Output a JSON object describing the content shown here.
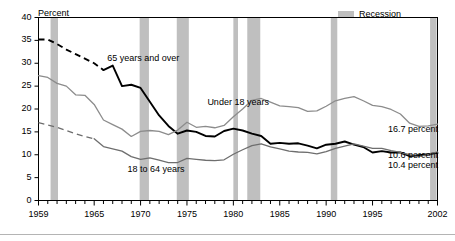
{
  "chart_data": {
    "type": "line",
    "title": "",
    "xlabel": "",
    "ylabel": "Percent",
    "ylim": [
      0,
      40
    ],
    "xlim": [
      1959,
      2002
    ],
    "yticks": [
      0,
      5,
      10,
      15,
      20,
      25,
      30,
      35,
      40
    ],
    "ytick_labels": [
      "0",
      "5",
      "10",
      "15",
      "20",
      "25",
      "30",
      "35",
      "40"
    ],
    "xticks": [
      1959,
      1965,
      1970,
      1975,
      1980,
      1985,
      1990,
      1995,
      2002
    ],
    "xtick_labels": [
      "1959",
      "1965",
      "1970",
      "1975",
      "1980",
      "1985",
      "1990",
      "1995",
      "2002"
    ],
    "minor_xticks_every": 1,
    "grid": false,
    "legend_position": "top-right",
    "legend": [
      {
        "label": "Recession",
        "color": "#bfbfbf",
        "type": "band"
      }
    ],
    "series": [
      {
        "name": "65 years and over",
        "color": "#000000",
        "width": 1.9,
        "label_x": 1966.4,
        "label_y": 31.0,
        "end_label": "10.4 percent",
        "dashed_prefix_years": 7,
        "x": [
          1959,
          1960,
          1961,
          1962,
          1963,
          1964,
          1965,
          1966,
          1967,
          1968,
          1969,
          1970,
          1971,
          1972,
          1973,
          1974,
          1975,
          1976,
          1977,
          1978,
          1979,
          1980,
          1981,
          1982,
          1983,
          1984,
          1985,
          1986,
          1987,
          1988,
          1989,
          1990,
          1991,
          1992,
          1993,
          1994,
          1995,
          1996,
          1997,
          1998,
          1999,
          2000,
          2001,
          2002
        ],
        "y": [
          35.2,
          35.2,
          34.2,
          33.0,
          32.0,
          31.0,
          30.0,
          28.5,
          29.5,
          25.0,
          25.3,
          24.6,
          21.6,
          18.6,
          16.3,
          14.6,
          15.3,
          15.0,
          14.1,
          14.0,
          15.2,
          15.7,
          15.3,
          14.6,
          14.1,
          12.4,
          12.6,
          12.4,
          12.5,
          12.0,
          11.4,
          12.2,
          12.4,
          12.9,
          12.2,
          11.7,
          10.5,
          10.8,
          10.5,
          10.5,
          9.7,
          9.9,
          10.1,
          10.4
        ]
      },
      {
        "name": "Under 18 years",
        "color": "#8c8c8c",
        "width": 1.3,
        "label_x": 1977.2,
        "label_y": 21.3,
        "end_label": "16.7 percent",
        "x": [
          1959,
          1960,
          1961,
          1962,
          1963,
          1964,
          1965,
          1966,
          1967,
          1968,
          1969,
          1970,
          1971,
          1972,
          1973,
          1974,
          1975,
          1976,
          1977,
          1978,
          1979,
          1980,
          1981,
          1982,
          1983,
          1984,
          1985,
          1986,
          1987,
          1988,
          1989,
          1990,
          1991,
          1992,
          1993,
          1994,
          1995,
          1996,
          1997,
          1998,
          1999,
          2000,
          2001,
          2002
        ],
        "y": [
          27.3,
          26.9,
          25.6,
          25.0,
          23.1,
          23.0,
          21.0,
          17.6,
          16.6,
          15.6,
          14.0,
          15.1,
          15.3,
          15.1,
          14.4,
          15.4,
          17.1,
          16.0,
          16.2,
          15.9,
          16.4,
          18.3,
          20.0,
          21.9,
          22.3,
          21.5,
          20.7,
          20.5,
          20.3,
          19.5,
          19.6,
          20.6,
          21.8,
          22.3,
          22.7,
          21.8,
          20.8,
          20.5,
          19.9,
          18.9,
          16.9,
          16.2,
          16.3,
          16.7
        ]
      },
      {
        "name": "18 to 64 years",
        "color": "#6e6e6e",
        "width": 1.3,
        "label_x": 1968.6,
        "label_y": 6.7,
        "end_label": "10.6 percent",
        "dashed_prefix_years": 6,
        "x": [
          1959,
          1960,
          1961,
          1962,
          1963,
          1964,
          1965,
          1966,
          1967,
          1968,
          1969,
          1970,
          1971,
          1972,
          1973,
          1974,
          1975,
          1976,
          1977,
          1978,
          1979,
          1980,
          1981,
          1982,
          1983,
          1984,
          1985,
          1986,
          1987,
          1988,
          1989,
          1990,
          1991,
          1992,
          1993,
          1994,
          1995,
          1996,
          1997,
          1998,
          1999,
          2000,
          2001,
          2002
        ],
        "y": [
          17.0,
          16.5,
          16.0,
          15.3,
          14.6,
          14.0,
          13.5,
          11.8,
          11.3,
          10.8,
          9.6,
          9.0,
          9.3,
          8.8,
          8.3,
          8.3,
          9.2,
          9.0,
          8.8,
          8.7,
          8.9,
          10.1,
          11.1,
          12.0,
          12.4,
          11.7,
          11.3,
          10.8,
          10.6,
          10.5,
          10.2,
          10.7,
          11.4,
          11.9,
          12.4,
          11.9,
          11.4,
          11.4,
          10.9,
          10.5,
          10.0,
          9.6,
          10.1,
          10.6
        ]
      }
    ],
    "recessions": [
      {
        "start": 1960.3,
        "end": 1961.1
      },
      {
        "start": 1969.9,
        "end": 1970.9
      },
      {
        "start": 1973.9,
        "end": 1975.2
      },
      {
        "start": 1980.0,
        "end": 1980.5
      },
      {
        "start": 1981.5,
        "end": 1982.9
      },
      {
        "start": 1990.5,
        "end": 1991.2
      },
      {
        "start": 2001.2,
        "end": 2001.9
      }
    ],
    "recession_color": "#bfbfbf",
    "axis_color": "#000000",
    "background": "#ffffff"
  },
  "legend": {
    "recession_label": "Recession"
  },
  "axis": {
    "y_title": "Percent"
  }
}
